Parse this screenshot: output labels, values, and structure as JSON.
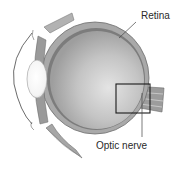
{
  "diagram": {
    "labels": {
      "retina": "Retina",
      "optic_nerve": "Optic nerve"
    },
    "colors": {
      "background": "#ffffff",
      "vitreous": "#b9b9b9",
      "vitreous_highlight": "#e2e2e2",
      "sclera": "#a8a8a8",
      "sclera_outline": "#6e6e6e",
      "retina_layer": "#7a7a7a",
      "lens": "#ffffff",
      "nerve": "#9a9a9a",
      "box_outline": "#1a1a1a",
      "text": "#2a2a2a"
    }
  }
}
